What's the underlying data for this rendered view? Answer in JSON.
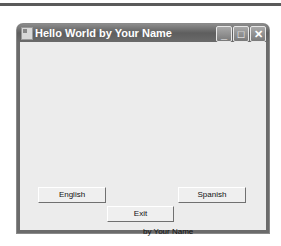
{
  "window": {
    "title": "Hello World by Your Name",
    "controls": {
      "minimize": "_",
      "maximize": "□",
      "close": "✕"
    }
  },
  "form": {
    "buttons": [
      {
        "label": "English"
      },
      {
        "label": "Spanish"
      },
      {
        "label": "Exit"
      }
    ],
    "footer_label": "by Your Name"
  }
}
